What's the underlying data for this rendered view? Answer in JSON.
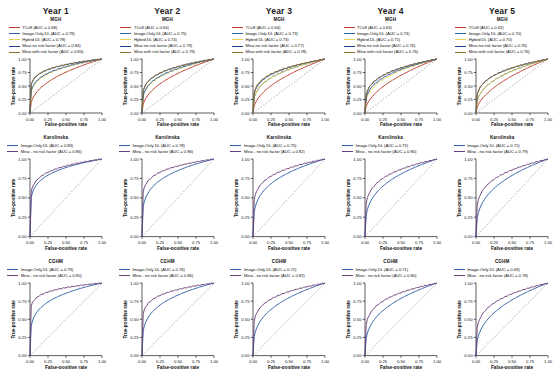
{
  "figure": {
    "columns": [
      "Year 1",
      "Year 2",
      "Year 3",
      "Year 4",
      "Year 5"
    ],
    "rows": [
      "MGH",
      "Karolinska",
      "CGHM"
    ],
    "axis": {
      "xlabel": "False-positive rate",
      "ylabel": "True-positive rate",
      "ticks": [
        "0.00",
        "0.25",
        "0.50",
        "0.75",
        "1.00"
      ],
      "xlim": [
        0,
        1
      ],
      "ylim": [
        0,
        1
      ]
    },
    "colors": {
      "tcv8": "#c0392b",
      "image_only_dl": "#2f5fa8",
      "hybrid_dl": "#e8d44d",
      "mirai_no_risk_factor": "#1f3f8f",
      "mirai_with_risk_factor": "#8e6f2e",
      "diagonal": "#808080",
      "axis": "#1a1a1a"
    }
  },
  "chart_data": {
    "type": "line",
    "xlabel": "False-positive rate",
    "ylabel": "True-positive rate",
    "xlim": [
      0,
      1
    ],
    "ylim": [
      0,
      1
    ],
    "grid": false,
    "legend_position": "top",
    "tick_labels": [
      "0.00",
      "0.25",
      "0.50",
      "0.75",
      "1.00"
    ],
    "panels": [
      {
        "row": "MGH",
        "column": "Year 1",
        "series": [
          {
            "name": "TCv8",
            "auc": 0.68,
            "color": "#c0392b"
          },
          {
            "name": "Image-Only DL",
            "auc": 0.79,
            "color": "#2f5fa8"
          },
          {
            "name": "Hybrid DL",
            "auc": 0.78,
            "color": "#e8d44d"
          },
          {
            "name": "Mirai no risk factor",
            "auc": 0.84,
            "color": "#1f3f8f"
          },
          {
            "name": "Mirai with risk factor",
            "auc": 0.84,
            "color": "#8e6f2e"
          }
        ]
      },
      {
        "row": "MGH",
        "column": "Year 2",
        "series": [
          {
            "name": "TCv8",
            "auc": 0.66,
            "color": "#c0392b"
          },
          {
            "name": "Image-Only DL",
            "auc": 0.75,
            "color": "#2f5fa8"
          },
          {
            "name": "Hybrid DL",
            "auc": 0.74,
            "color": "#e8d44d"
          },
          {
            "name": "Mirai no risk factor",
            "auc": 0.79,
            "color": "#1f3f8f"
          },
          {
            "name": "Mirai with risk factor",
            "auc": 0.79,
            "color": "#8e6f2e"
          }
        ]
      },
      {
        "row": "MGH",
        "column": "Year 3",
        "series": [
          {
            "name": "TCv8",
            "auc": 0.64,
            "color": "#c0392b"
          },
          {
            "name": "Image-Only DL",
            "auc": 0.73,
            "color": "#2f5fa8"
          },
          {
            "name": "Hybrid DL",
            "auc": 0.73,
            "color": "#e8d44d"
          },
          {
            "name": "Mirai no risk factor",
            "auc": 0.77,
            "color": "#1f3f8f"
          },
          {
            "name": "Mirai with risk factor",
            "auc": 0.78,
            "color": "#8e6f2e"
          }
        ]
      },
      {
        "row": "MGH",
        "column": "Year 4",
        "series": [
          {
            "name": "TCv8",
            "auc": 0.63,
            "color": "#c0392b"
          },
          {
            "name": "Image-Only DL",
            "auc": 0.73,
            "color": "#2f5fa8"
          },
          {
            "name": "Hybrid DL",
            "auc": 0.71,
            "color": "#e8d44d"
          },
          {
            "name": "Mirai no risk factor",
            "auc": 0.76,
            "color": "#1f3f8f"
          },
          {
            "name": "Mirai with risk factor",
            "auc": 0.76,
            "color": "#8e6f2e"
          }
        ]
      },
      {
        "row": "MGH",
        "column": "Year 5",
        "series": [
          {
            "name": "TCv8",
            "auc": 0.62,
            "color": "#c0392b"
          },
          {
            "name": "Image-Only DL",
            "auc": 0.7,
            "color": "#2f5fa8"
          },
          {
            "name": "Hybrid DL",
            "auc": 0.7,
            "color": "#e8d44d"
          },
          {
            "name": "Mirai no risk factor",
            "auc": 0.76,
            "color": "#1f3f8f"
          },
          {
            "name": "Mirai with risk factor",
            "auc": 0.76,
            "color": "#8e6f2e"
          }
        ]
      },
      {
        "row": "Karolinska",
        "column": "Year 1",
        "series": [
          {
            "name": "Image-Only DL",
            "auc": 0.83,
            "color": "#2f5fa8"
          },
          {
            "name": "Mirai - no risk factor",
            "auc": 0.86,
            "color": "#6b3f7a"
          }
        ]
      },
      {
        "row": "Karolinska",
        "column": "Year 2",
        "series": [
          {
            "name": "Image-Only DL",
            "auc": 0.78,
            "color": "#2f5fa8"
          },
          {
            "name": "Mirai - no risk factor",
            "auc": 0.86,
            "color": "#6b3f7a"
          }
        ]
      },
      {
        "row": "Karolinska",
        "column": "Year 3",
        "series": [
          {
            "name": "Image-Only DL",
            "auc": 0.75,
            "color": "#2f5fa8"
          },
          {
            "name": "Mirai - no risk factor",
            "auc": 0.82,
            "color": "#6b3f7a"
          }
        ]
      },
      {
        "row": "Karolinska",
        "column": "Year 4",
        "series": [
          {
            "name": "Image-Only DL",
            "auc": 0.73,
            "color": "#2f5fa8"
          },
          {
            "name": "Mirai - no risk factor",
            "auc": 0.8,
            "color": "#6b3f7a"
          }
        ]
      },
      {
        "row": "Karolinska",
        "column": "Year 5",
        "series": [
          {
            "name": "Image-Only DL",
            "auc": 0.71,
            "color": "#2f5fa8"
          },
          {
            "name": "Mirai - no risk factor",
            "auc": 0.79,
            "color": "#6b3f7a"
          }
        ]
      },
      {
        "row": "CGHM",
        "column": "Year 1",
        "series": [
          {
            "name": "Image-Only DL",
            "auc": 0.79,
            "color": "#2f5fa8"
          },
          {
            "name": "Mirai - no risk factor",
            "auc": 0.9,
            "color": "#6b3f7a"
          }
        ]
      },
      {
        "row": "CGHM",
        "column": "Year 2",
        "series": [
          {
            "name": "Image-Only DL",
            "auc": 0.76,
            "color": "#2f5fa8"
          },
          {
            "name": "Mirai - no risk factor",
            "auc": 0.86,
            "color": "#6b3f7a"
          }
        ]
      },
      {
        "row": "CGHM",
        "column": "Year 3",
        "series": [
          {
            "name": "Image-Only DL",
            "auc": 0.72,
            "color": "#2f5fa8"
          },
          {
            "name": "Mirai - no risk factor",
            "auc": 0.82,
            "color": "#6b3f7a"
          }
        ]
      },
      {
        "row": "CGHM",
        "column": "Year 4",
        "series": [
          {
            "name": "Image-Only DL",
            "auc": 0.71,
            "color": "#2f5fa8"
          },
          {
            "name": "Mirai - no risk factor",
            "auc": 0.8,
            "color": "#6b3f7a"
          }
        ]
      },
      {
        "row": "CGHM",
        "column": "Year 5",
        "series": [
          {
            "name": "Image-Only DL",
            "auc": 0.69,
            "color": "#2f5fa8"
          },
          {
            "name": "Mirai - no risk factor",
            "auc": 0.78,
            "color": "#6b3f7a"
          }
        ]
      }
    ]
  }
}
